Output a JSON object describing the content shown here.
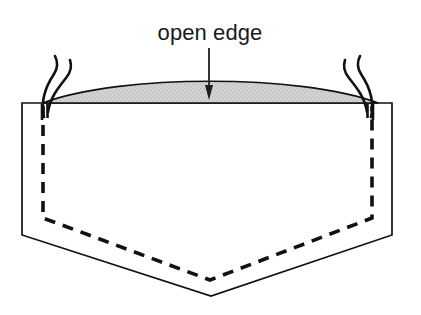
{
  "figure": {
    "type": "sewing-pattern-diagram",
    "background_color": "#ffffff",
    "line_color": "#111111",
    "shade_color": "#c9c9c9",
    "annotation": {
      "label": "open edge",
      "label_x": 210,
      "label_y": 40,
      "font_size_px": 22,
      "arrow": {
        "name": "down-arrow",
        "from_x": 209,
        "from_y": 48,
        "to_x": 209,
        "to_y": 99,
        "head_width": 9,
        "head_height": 13
      }
    },
    "body_outline": {
      "name": "fabric-outline",
      "points": "22,103 392,103 392,235 211,296 22,235",
      "fill": "#ffffff",
      "stroke_width": 1.7
    },
    "stitch_line": {
      "name": "dashed-stitch-line",
      "points": "43,106 43,218 210,280 372,218 372,106",
      "dash_pattern": "11 8",
      "stroke_width": 3.6
    },
    "shaded_band": {
      "name": "open-edge-band",
      "left_x": 43,
      "right_x": 378,
      "baseline_y": 103,
      "peak_y": 83,
      "fill": "#c9c9c9"
    },
    "threads": [
      {
        "name": "thread-left-inner",
        "path": "M 44 117 C 40 100 46 86 54 74 C 58 68 58 62 55 56"
      },
      {
        "name": "thread-left-outer",
        "path": "M 48 112 C 50 98 58 88 66 78 C 71 72 72 66 70 60"
      },
      {
        "name": "thread-right-inner",
        "path": "M 371 117 C 375 100 369 86 361 74 C 357 68 357 62 360 56"
      },
      {
        "name": "thread-right-outer",
        "path": "M 367 112 C 365 98 357 88 349 78 C 344 72 343 66 345 60"
      }
    ],
    "tacks": [
      {
        "name": "tack-left-a",
        "x": 42,
        "y1": 104,
        "y2": 120
      },
      {
        "name": "tack-left-b",
        "x": 47,
        "y1": 104,
        "y2": 118
      },
      {
        "name": "tack-right-a",
        "x": 373,
        "y1": 104,
        "y2": 120
      },
      {
        "name": "tack-right-b",
        "x": 368,
        "y1": 104,
        "y2": 118
      }
    ]
  }
}
